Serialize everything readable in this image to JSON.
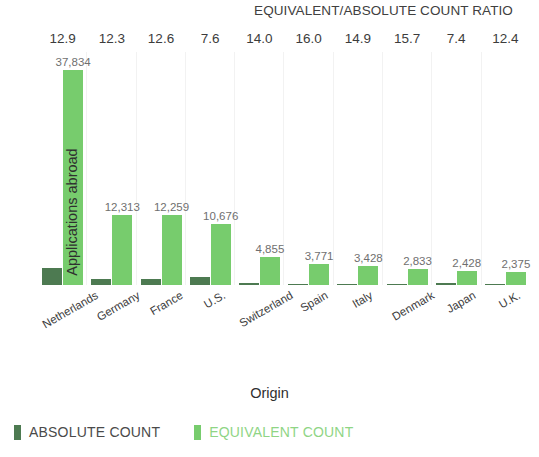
{
  "chart_data": {
    "type": "bar",
    "title": "EQUIVALENT/ABSOLUTE COUNT RATIO",
    "xlabel": "Origin",
    "ylabel": "Applications abroad",
    "categories": [
      "Netherlands",
      "Germany",
      "France",
      "U.S.",
      "Switzerland",
      "Spain",
      "Italy",
      "Denmark",
      "Japan",
      "U.K."
    ],
    "series": [
      {
        "name": "ABSOLUTE COUNT",
        "color": "#4d7a51",
        "values": [
          2933,
          1001,
          973,
          1405,
          347,
          236,
          230,
          180,
          328,
          192
        ],
        "labels": [
          "",
          "",
          "",
          "",
          "",
          "",
          "",
          "",
          "",
          ""
        ]
      },
      {
        "name": "EQUIVALENT COUNT",
        "color": "#77cc6d",
        "values": [
          37834,
          12313,
          12259,
          10676,
          4855,
          3771,
          3428,
          2833,
          2428,
          2375
        ],
        "labels": [
          "37,834",
          "12,313",
          "12,259",
          "10,676",
          "4,855",
          "3,771",
          "3,428",
          "2,833",
          "2,428",
          "2,375"
        ]
      }
    ],
    "ratio_header_label": "EQUIVALENT/ABSOLUTE COUNT RATIO",
    "ratios": [
      "12.9",
      "12.3",
      "12.6",
      "7.6",
      "14.0",
      "16.0",
      "14.9",
      "15.7",
      "7.4",
      "12.4"
    ],
    "ylim": [
      0,
      41000
    ],
    "grid": "vertical-category-separators",
    "legend_position": "bottom-left"
  },
  "legend": {
    "absolute": "ABSOLUTE COUNT",
    "equivalent": "EQUIVALENT COUNT"
  }
}
